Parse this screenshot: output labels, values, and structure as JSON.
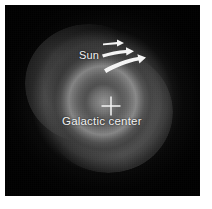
{
  "figure": {
    "kind": "astronomical-grayscale-image",
    "plate_background_color": "#050505",
    "page_background_color": "#ffffff",
    "annotation_color": "#f2f2f2"
  },
  "annotations": {
    "sun": {
      "label": "Sun",
      "icon": "rotation-arrows-icon",
      "arrow_count": 3,
      "arrow_meaning": "direction of galactic rotation"
    },
    "galactic_center": {
      "label": "Galactic center",
      "icon": "cross-marker-icon"
    }
  }
}
